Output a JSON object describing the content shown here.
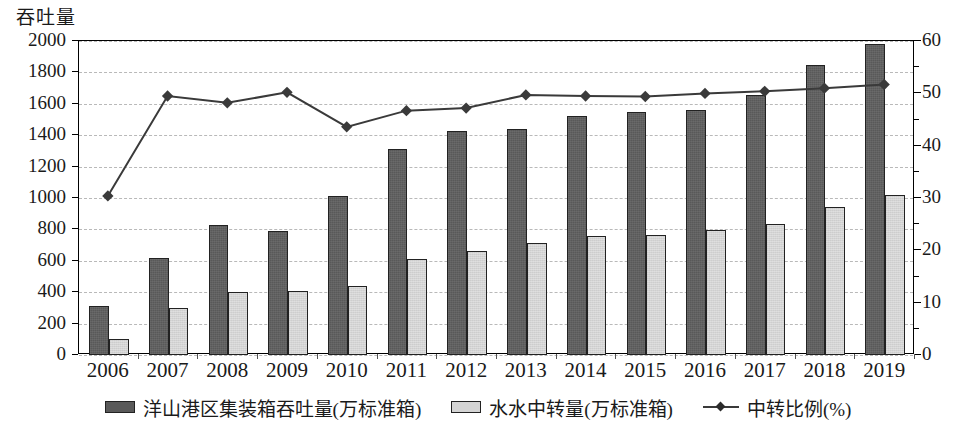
{
  "chart_data": {
    "type": "bar",
    "title": "",
    "ylabel": "吞吐量",
    "xlabel": "",
    "categories": [
      "2006",
      "2007",
      "2008",
      "2009",
      "2010",
      "2011",
      "2012",
      "2013",
      "2014",
      "2015",
      "2016",
      "2017",
      "2018",
      "2019"
    ],
    "ylim": [
      0,
      2000
    ],
    "y2lim": [
      0,
      60
    ],
    "ytick_labels": [
      "2000",
      "1800",
      "1600",
      "1400",
      "1200",
      "1000",
      "800",
      "600",
      "400",
      "200",
      "0"
    ],
    "ytick_values": [
      2000,
      1800,
      1600,
      1400,
      1200,
      1000,
      800,
      600,
      400,
      200,
      0
    ],
    "y2tick_labels": [
      "60",
      "50",
      "40",
      "30",
      "20",
      "10",
      "0"
    ],
    "y2tick_values": [
      60,
      50,
      40,
      30,
      20,
      10,
      0
    ],
    "grid": true,
    "legend_position": "bottom",
    "series": [
      {
        "name": "洋山港区集装箱吞吐量(万标准箱)",
        "type": "bar",
        "axis": "left",
        "color": "#595959",
        "values": [
          310,
          615,
          825,
          790,
          1015,
          1310,
          1425,
          1440,
          1520,
          1545,
          1560,
          1655,
          1845,
          1980
        ]
      },
      {
        "name": "水水中转量(万标准箱)",
        "type": "bar",
        "axis": "left",
        "color": "#d4d4d4",
        "values": [
          100,
          300,
          400,
          405,
          440,
          610,
          665,
          715,
          755,
          765,
          795,
          835,
          940,
          1020
        ]
      },
      {
        "name": "中转比例(%)",
        "type": "line",
        "axis": "right",
        "color": "#3a3a3a",
        "marker": "diamond",
        "values": [
          30.2,
          49.3,
          48.0,
          50.0,
          43.4,
          46.5,
          47.0,
          49.5,
          49.3,
          49.2,
          49.8,
          50.2,
          50.8,
          51.5
        ]
      }
    ]
  },
  "legend": {
    "items": [
      {
        "label": "洋山港区集装箱吞吐量(万标准箱)",
        "swatch": "dark-bar-swatch"
      },
      {
        "label": "水水中转量(万标准箱)",
        "swatch": "light-bar-swatch"
      },
      {
        "label": "中转比例(%)",
        "swatch": "line-marker-swatch"
      }
    ]
  }
}
